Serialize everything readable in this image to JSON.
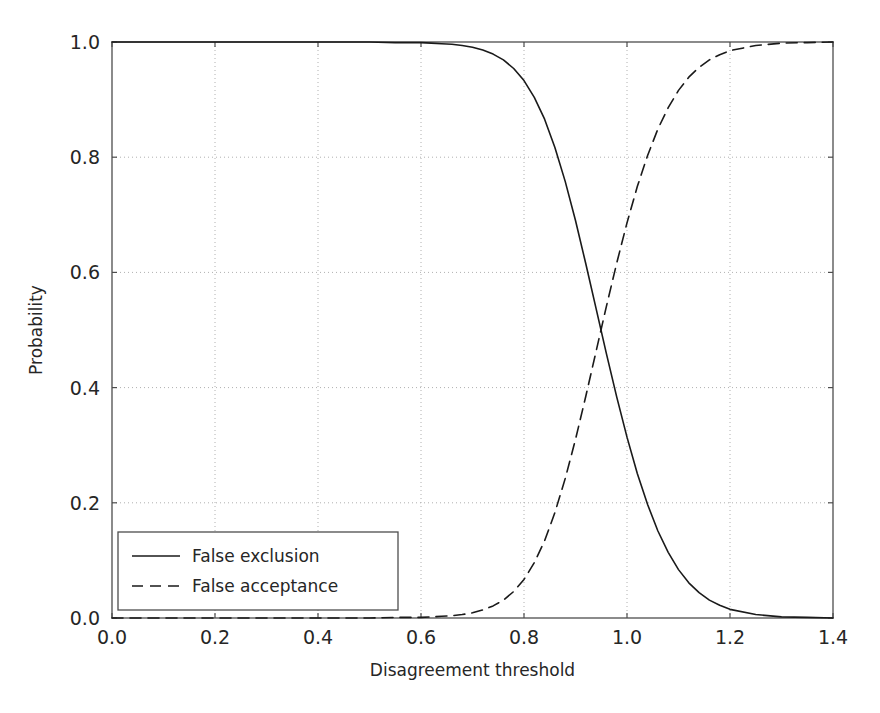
{
  "chart_data": {
    "type": "line",
    "title": "",
    "xlabel": "Disagreement threshold",
    "ylabel": "Probability",
    "xlim": [
      0.0,
      1.4
    ],
    "ylim": [
      0.0,
      1.0
    ],
    "xticks": [
      "0.0",
      "0.2",
      "0.4",
      "0.6",
      "0.8",
      "1.0",
      "1.2",
      "1.4"
    ],
    "xtick_values": [
      0.0,
      0.2,
      0.4,
      0.6,
      0.8,
      1.0,
      1.2,
      1.4
    ],
    "yticks": [
      "0.0",
      "0.2",
      "0.4",
      "0.6",
      "0.8",
      "1.0"
    ],
    "ytick_values": [
      0.0,
      0.2,
      0.4,
      0.6,
      0.8,
      1.0
    ],
    "grid": true,
    "grid_style": "dotted",
    "legend_position": "lower left",
    "series": [
      {
        "name": "False exclusion",
        "style": "solid",
        "color": "#1a1a1a",
        "x": [
          0.0,
          0.05,
          0.1,
          0.15,
          0.2,
          0.25,
          0.3,
          0.35,
          0.4,
          0.45,
          0.5,
          0.55,
          0.58,
          0.6,
          0.62,
          0.64,
          0.66,
          0.68,
          0.7,
          0.72,
          0.74,
          0.76,
          0.78,
          0.8,
          0.82,
          0.84,
          0.86,
          0.88,
          0.9,
          0.92,
          0.94,
          0.96,
          0.98,
          1.0,
          1.02,
          1.04,
          1.06,
          1.08,
          1.1,
          1.12,
          1.14,
          1.16,
          1.18,
          1.2,
          1.25,
          1.3,
          1.35,
          1.4
        ],
        "y": [
          1.0,
          1.0,
          1.0,
          1.0,
          1.0,
          1.0,
          1.0,
          1.0,
          1.0,
          1.0,
          1.0,
          0.999,
          0.999,
          0.999,
          0.998,
          0.997,
          0.996,
          0.994,
          0.991,
          0.986,
          0.979,
          0.969,
          0.954,
          0.933,
          0.904,
          0.866,
          0.817,
          0.758,
          0.69,
          0.615,
          0.537,
          0.459,
          0.384,
          0.314,
          0.251,
          0.197,
          0.151,
          0.114,
          0.084,
          0.061,
          0.044,
          0.031,
          0.022,
          0.015,
          0.006,
          0.002,
          0.001,
          0.0
        ]
      },
      {
        "name": "False acceptance",
        "style": "dashed",
        "color": "#1a1a1a",
        "x": [
          0.0,
          0.05,
          0.1,
          0.15,
          0.2,
          0.25,
          0.3,
          0.35,
          0.4,
          0.45,
          0.5,
          0.55,
          0.58,
          0.6,
          0.62,
          0.64,
          0.66,
          0.68,
          0.7,
          0.72,
          0.74,
          0.76,
          0.78,
          0.8,
          0.82,
          0.84,
          0.86,
          0.88,
          0.9,
          0.92,
          0.94,
          0.96,
          0.98,
          1.0,
          1.02,
          1.04,
          1.06,
          1.08,
          1.1,
          1.12,
          1.14,
          1.16,
          1.18,
          1.2,
          1.25,
          1.3,
          1.35,
          1.4
        ],
        "y": [
          0.0,
          0.0,
          0.0,
          0.0,
          0.0,
          0.0,
          0.0,
          0.0,
          0.0,
          0.0,
          0.0,
          0.001,
          0.001,
          0.001,
          0.002,
          0.003,
          0.004,
          0.006,
          0.009,
          0.014,
          0.021,
          0.031,
          0.046,
          0.067,
          0.096,
          0.134,
          0.183,
          0.242,
          0.31,
          0.385,
          0.463,
          0.541,
          0.616,
          0.686,
          0.749,
          0.803,
          0.849,
          0.886,
          0.916,
          0.939,
          0.956,
          0.969,
          0.978,
          0.985,
          0.994,
          0.998,
          0.999,
          1.0
        ]
      }
    ],
    "annotations": {
      "crossover_x": 0.905,
      "crossover_y": 0.5
    }
  },
  "legend": {
    "items": [
      {
        "label": "False exclusion",
        "style": "solid"
      },
      {
        "label": "False acceptance",
        "style": "dashed"
      }
    ]
  }
}
